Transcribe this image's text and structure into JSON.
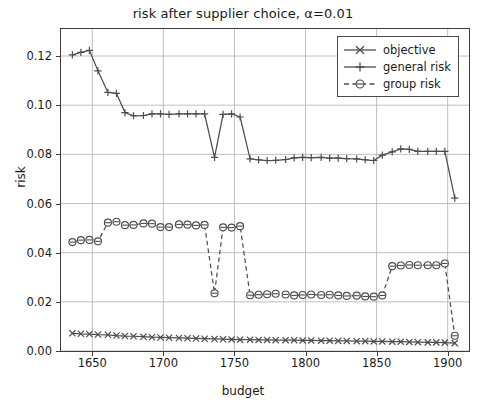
{
  "chart_data": {
    "type": "line",
    "title": "risk after supplier choice, α=0.01",
    "xlabel": "budget",
    "ylabel": "risk",
    "xlim": [
      1628,
      1915
    ],
    "ylim": [
      0.0,
      0.131
    ],
    "xticks": [
      1650,
      1700,
      1750,
      1800,
      1850,
      1900
    ],
    "xticklabels": [
      "1650",
      "1700",
      "1750",
      "1800",
      "1850",
      "1900"
    ],
    "yticks": [
      0.0,
      0.02,
      0.04,
      0.06,
      0.08,
      0.1,
      0.12
    ],
    "yticklabels": [
      "0.00",
      "0.02",
      "0.04",
      "0.06",
      "0.08",
      "0.10",
      "0.12"
    ],
    "grid": true,
    "legend_position": "upper right",
    "series": [
      {
        "name": "objective",
        "marker": "x",
        "linestyle": "solid",
        "color": "#4d4d4d",
        "x": [
          1636,
          1642,
          1648,
          1654,
          1661,
          1667,
          1673,
          1679,
          1686,
          1692,
          1698,
          1704,
          1711,
          1717,
          1723,
          1729,
          1736,
          1742,
          1748,
          1754,
          1761,
          1767,
          1773,
          1779,
          1786,
          1792,
          1798,
          1804,
          1811,
          1817,
          1823,
          1829,
          1836,
          1842,
          1848,
          1854,
          1861,
          1867,
          1873,
          1879,
          1886,
          1892,
          1898,
          1905
        ],
        "y": [
          0.0072,
          0.007,
          0.0069,
          0.0067,
          0.0066,
          0.0063,
          0.0061,
          0.006,
          0.0058,
          0.0056,
          0.0055,
          0.0054,
          0.0053,
          0.0052,
          0.0051,
          0.005,
          0.0049,
          0.0048,
          0.0047,
          0.0046,
          0.0046,
          0.0045,
          0.0045,
          0.0044,
          0.0044,
          0.0044,
          0.0043,
          0.0043,
          0.0042,
          0.0042,
          0.0041,
          0.0041,
          0.004,
          0.004,
          0.0039,
          0.0039,
          0.0038,
          0.0038,
          0.0037,
          0.0036,
          0.0035,
          0.0035,
          0.0034,
          0.0032
        ]
      },
      {
        "name": "general risk",
        "marker": "+",
        "linestyle": "solid",
        "color": "#4d4d4d",
        "x": [
          1636,
          1642,
          1648,
          1654,
          1661,
          1667,
          1673,
          1679,
          1686,
          1692,
          1698,
          1704,
          1711,
          1717,
          1723,
          1729,
          1736,
          1742,
          1748,
          1754,
          1761,
          1767,
          1773,
          1779,
          1786,
          1792,
          1798,
          1804,
          1811,
          1817,
          1823,
          1829,
          1836,
          1842,
          1848,
          1854,
          1861,
          1867,
          1873,
          1879,
          1886,
          1892,
          1898,
          1905
        ],
        "y": [
          0.1205,
          0.1215,
          0.1223,
          0.114,
          0.1052,
          0.1048,
          0.097,
          0.0957,
          0.0958,
          0.0965,
          0.0965,
          0.0963,
          0.0965,
          0.0965,
          0.0965,
          0.0965,
          0.0788,
          0.0963,
          0.0965,
          0.0952,
          0.0782,
          0.0778,
          0.0775,
          0.0776,
          0.0779,
          0.0786,
          0.0788,
          0.0787,
          0.0788,
          0.0785,
          0.0785,
          0.0783,
          0.0782,
          0.0778,
          0.0775,
          0.0797,
          0.081,
          0.0822,
          0.082,
          0.0812,
          0.0812,
          0.0812,
          0.0812,
          0.0622
        ]
      },
      {
        "name": "group risk",
        "marker": "o-dash",
        "linestyle": "dashed",
        "color": "#4d4d4d",
        "x": [
          1636,
          1642,
          1648,
          1654,
          1661,
          1667,
          1673,
          1679,
          1686,
          1692,
          1698,
          1704,
          1711,
          1717,
          1723,
          1729,
          1736,
          1742,
          1748,
          1754,
          1761,
          1767,
          1773,
          1779,
          1786,
          1792,
          1798,
          1804,
          1811,
          1817,
          1823,
          1829,
          1836,
          1842,
          1848,
          1854,
          1861,
          1867,
          1873,
          1879,
          1886,
          1892,
          1898,
          1905
        ],
        "y": [
          0.0443,
          0.0451,
          0.0452,
          0.0446,
          0.0522,
          0.0526,
          0.0512,
          0.0513,
          0.0519,
          0.0518,
          0.0504,
          0.0504,
          0.0515,
          0.0514,
          0.0511,
          0.0513,
          0.0235,
          0.0503,
          0.0502,
          0.0508,
          0.0227,
          0.0229,
          0.0231,
          0.0233,
          0.023,
          0.0226,
          0.0228,
          0.023,
          0.0228,
          0.0229,
          0.0226,
          0.0224,
          0.0225,
          0.0222,
          0.0221,
          0.0226,
          0.0345,
          0.0348,
          0.035,
          0.0349,
          0.0349,
          0.0349,
          0.0356,
          0.0062
        ]
      }
    ]
  },
  "legend": {
    "items": [
      {
        "label": "objective",
        "marker": "x"
      },
      {
        "label": "general risk",
        "marker": "plus"
      },
      {
        "label": "group risk",
        "marker": "circle-dash"
      }
    ]
  }
}
